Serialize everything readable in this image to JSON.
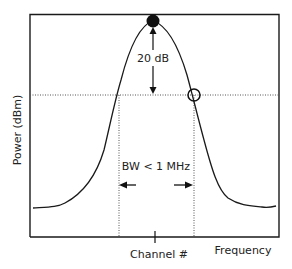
{
  "diagram": {
    "ylabel": "Power (dBm)",
    "xlabel": "Frequency",
    "center_label": "Channel #",
    "level_annotation": "20 dB",
    "bandwidth_annotation": "BW < 1 MHz"
  },
  "colors": {
    "line": "#1a1a1a",
    "dotted": "#666666",
    "background": "#ffffff"
  }
}
